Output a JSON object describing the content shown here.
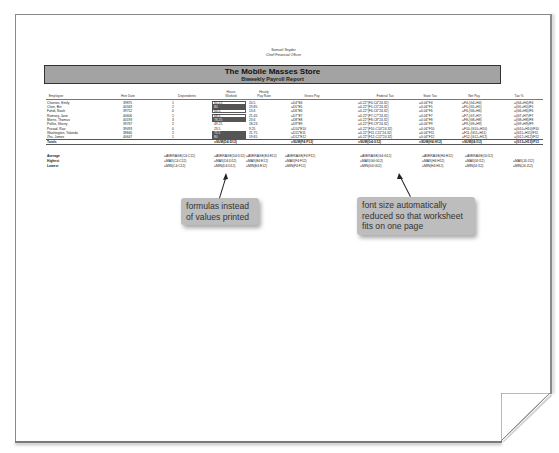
{
  "header": {
    "name": "Samuel Snyder",
    "title": "Chief Financial Officer"
  },
  "banner": {
    "title": "The Mobile Masses Store",
    "subtitle": "Biweekly Payroll Report",
    "fill_color": "#a3a3a3"
  },
  "columns": [
    {
      "label": "Employee"
    },
    {
      "label": "Hire Date"
    },
    {
      "label": "Dependents"
    },
    {
      "label": "Hours\nWorked"
    },
    {
      "label": "Hourly\nPay Rate"
    },
    {
      "label": "Gross Pay"
    },
    {
      "label": "Federal Tax"
    },
    {
      "label": "State Tax"
    },
    {
      "label": "Net Pay"
    },
    {
      "label": "Tax %"
    }
  ],
  "rows": [
    {
      "employee": "Charnes, Emily",
      "hire": "39875",
      "dep": "1",
      "hours": "65.25",
      "rate": "20.5",
      "gross": "=D4*E4",
      "fed": "=0.22*(F4-C4*24.32)",
      "state": "=0.04*F4",
      "net": "=F4-(G4+H4)",
      "taxpct": "=(G4+H4)/F4",
      "bar": "outline"
    },
    {
      "employee": "Chen, Bin",
      "hire": "40343",
      "dep": "2",
      "hours": "80",
      "rate": "23.85",
      "gross": "=D5*E5",
      "fed": "=0.22*(F5-C5*24.32)",
      "state": "=0.04*F5",
      "net": "=F5-(G5+H5)",
      "taxpct": "=(G5+H5)/F5",
      "bar": "fill"
    },
    {
      "employee": "Fahdi, Noah",
      "hire": "39752",
      "dep": "0",
      "hours": "64.5",
      "rate": "13.6",
      "gross": "=D6*E6",
      "fed": "=0.22*(F6-C6*24.32)",
      "state": "=0.04*F6",
      "net": "=F6-(G6+H6)",
      "taxpct": "=(G6+H6)/F6",
      "bar": "outline"
    },
    {
      "employee": "Ramsey, Jane",
      "hire": "40606",
      "dep": "1",
      "hours": "68.5",
      "rate": "21.45",
      "gross": "=D7*E7",
      "fed": "=0.22*(F7-C7*24.32)",
      "state": "=0.04*F7",
      "net": "=F7-(G7+H7)",
      "taxpct": "=(G7+H7)/F7",
      "bar": "outline"
    },
    {
      "employee": "Morris, Thomas",
      "hire": "40193",
      "dep": "3",
      "hours": "78.25",
      "rate": "23.6",
      "gross": "=D8*E8",
      "fed": "=0.22*(F8-C8*24.32)",
      "state": "=0.04*F8",
      "net": "=F8-(G8+H8)",
      "taxpct": "=(G8+H8)/F8",
      "bar": "fill"
    },
    {
      "employee": "Pollito, Sherry",
      "hire": "39767",
      "dep": "2",
      "hours": "49.25",
      "rate": "18.23",
      "gross": "=D9*E9",
      "fed": "=0.22*(F9-C9*24.32)",
      "state": "=0.04*F9",
      "net": "=F9-(G9+H9)",
      "taxpct": "=(G9+H9)/F9",
      "bar": "none"
    },
    {
      "employee": "Prasad, Rao",
      "hire": "39493",
      "dep": "0",
      "hours": "23.5",
      "rate": "9.25",
      "gross": "=D10*E10",
      "fed": "=0.22*(F10-C10*24.32)",
      "state": "=0.04*F10",
      "net": "=F10-(G10+H10)",
      "taxpct": "=(G10+H10)/F10",
      "bar": "none"
    },
    {
      "employee": "Washington, Yolanda",
      "hire": "38840",
      "dep": "2",
      "hours": "75.5",
      "rate": "21.75",
      "gross": "=D11*E11",
      "fed": "=0.22*(F11-C11*24.32)",
      "state": "=0.04*F11",
      "net": "=F11-(G11+H11)",
      "taxpct": "=(G11+H11)/F11",
      "bar": "fill"
    },
    {
      "employee": "Zhu, James",
      "hire": "40647",
      "dep": "1",
      "hours": "80",
      "rate": "19.65",
      "gross": "=D12*E12",
      "fed": "=0.22*(F12-C12*24.32)",
      "state": "=0.04*F12",
      "net": "=F12-(G12+H12)",
      "taxpct": "=(G12+H12)/F12",
      "bar": "fill"
    }
  ],
  "totals": {
    "label": "Totals",
    "hours": "=SUM(D4:D12)",
    "gross": "=SUM(F4:F12)",
    "fed": "=SUM(G4:G12)",
    "state": "=SUM(H4:H12)",
    "net": "=SUM(I4:I12)",
    "taxpct": "=(G13+H13)/F13"
  },
  "stats": [
    {
      "label": "Average",
      "dep": "=AVERAGE(C4:C12)",
      "hours": "=AVERAGE(D4:D12)",
      "rate": "=AVERAGE(E4:E12)",
      "gross": "=AVERAGE(F4:F12)",
      "fed": "=AVERAGE(G4:G12)",
      "state": "=AVERAGE(H4:H12)",
      "net": "=AVERAGE(I4:I12)",
      "taxpct": ""
    },
    {
      "label": "Highest",
      "dep": "=MAX(C4:C12)",
      "hours": "=MAX(D4:D12)",
      "rate": "=MAX(E4:E12)",
      "gross": "=MAX(F4:F12)",
      "fed": "=MAX(G4:G12)",
      "state": "=MAX(H4:H12)",
      "net": "=MAX(I4:I12)",
      "taxpct": "=MAX(J4:J12)"
    },
    {
      "label": "Lowest",
      "dep": "=MIN(C4:C12)",
      "hours": "=MIN(D4:D12)",
      "rate": "=MIN(E4:E12)",
      "gross": "=MIN(F4:F12)",
      "fed": "=MIN(G4:G12)",
      "state": "=MIN(H4:H12)",
      "net": "=MIN(I4:I12)",
      "taxpct": "=MIN(J4:J12)"
    }
  ],
  "callouts": [
    {
      "text": "formulas instead of values printed"
    },
    {
      "text": "font size automatically reduced so that worksheet fits on one page"
    }
  ],
  "colors": {
    "callout_bg": "#bdbdbd",
    "page_border": "#8a8a8a"
  }
}
